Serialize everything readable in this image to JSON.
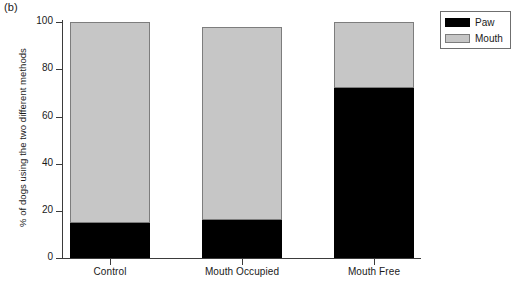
{
  "figure": {
    "panel_label": "(b)"
  },
  "chart_data": {
    "type": "bar",
    "subtype": "stacked-bar-100",
    "title": "",
    "panel_label": "(b)",
    "xlabel": "",
    "ylabel": "% of dogs using the two different methods",
    "categories": [
      "Control",
      "Mouth Occupied",
      "Mouth Free"
    ],
    "series": [
      {
        "name": "Paw",
        "color": "#000000",
        "values": [
          15,
          16,
          72
        ]
      },
      {
        "name": "Mouth",
        "color": "#c6c6c6",
        "values": [
          85,
          82,
          28
        ]
      }
    ],
    "bar_totals": [
      100,
      98,
      100
    ],
    "ylim": [
      0,
      100
    ],
    "yticks": [
      0,
      20,
      40,
      60,
      80,
      100
    ],
    "ytick_labels": [
      "0",
      "20",
      "40",
      "60",
      "80",
      "100"
    ],
    "grid": false,
    "legend": {
      "position": "top-right-outside",
      "entries": [
        {
          "label": "Paw",
          "color": "#000000"
        },
        {
          "label": "Mouth",
          "color": "#c6c6c6"
        }
      ]
    }
  }
}
